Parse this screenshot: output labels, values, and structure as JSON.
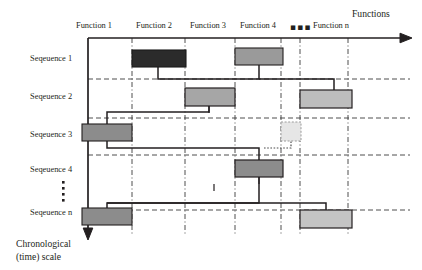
{
  "figure": {
    "type": "sequence-function-gantt-diagram",
    "columns_axis_label": "Functions",
    "rows_axis_label": "Chronological\n(time) scale",
    "horizontal_ellipsis": "▪▪▪",
    "vertical_ellipsis_dots": 5
  },
  "colors": {
    "bar_dark": "#2b2b2b",
    "bar_mid": "#8c8c8c",
    "bar_light": "#b9b9b9",
    "bar_pale": "#c9c9c9",
    "bar_ghost": "#e2e2e2",
    "stroke": "#231f20",
    "grid_dash": "#3a3a3a",
    "text": "#231f20"
  },
  "columns": [
    {
      "label": "Function 1",
      "center_x": 106,
      "divider_x": 132
    },
    {
      "label": "Function 2",
      "center_x": 159,
      "divider_x": 185
    },
    {
      "label": "Function 3",
      "center_x": 210,
      "divider_x": 235
    },
    {
      "label": "Function 4",
      "center_x": 258,
      "divider_x": 281
    },
    {
      "label": "▪▪▪",
      "center_x": 291,
      "divider_x": 300
    },
    {
      "label": "Function n",
      "center_x": 327,
      "divider_x": 348
    }
  ],
  "rows": [
    {
      "label": "Seqeuence 1",
      "label_y": 60,
      "separator_y": 79
    },
    {
      "label": "Seqeuence 2",
      "label_y": 98,
      "separator_y": 118
    },
    {
      "label": "Seqeuence 3",
      "label_y": 136,
      "separator_y": 155
    },
    {
      "label": "Seqeuence 4",
      "label_y": 171,
      "separator_y": 210
    },
    {
      "label": "Seqeuence n",
      "label_y": 214,
      "separator_y": null
    }
  ],
  "bars": [
    {
      "row": "Seqeuence 1",
      "column": "Function 2",
      "x": 132,
      "y": 50,
      "w": 54,
      "h": 17,
      "fill": "#2b2b2b",
      "ghost": false
    },
    {
      "row": "Seqeuence 1",
      "column": "Function 4",
      "x": 235,
      "y": 48,
      "w": 48,
      "h": 17,
      "fill": "#9a9a9a",
      "ghost": false
    },
    {
      "row": "Seqeuence 2",
      "column": "Function 3",
      "x": 185,
      "y": 88,
      "w": 50,
      "h": 18,
      "fill": "#a6a6a6",
      "ghost": false
    },
    {
      "row": "Seqeuence 2",
      "column": "Function n",
      "x": 300,
      "y": 90,
      "w": 52,
      "h": 18,
      "fill": "#bdbdbd",
      "ghost": false
    },
    {
      "row": "Seqeuence 3",
      "column": "Function 1",
      "x": 82,
      "y": 124,
      "w": 50,
      "h": 17,
      "fill": "#8c8c8c",
      "ghost": false
    },
    {
      "row": "Seqeuence 3",
      "column": "Function 4",
      "x": 281,
      "y": 122,
      "w": 20,
      "h": 19,
      "fill": "#e6e6e6",
      "ghost": true
    },
    {
      "row": "Seqeuence 4",
      "column": "Function 4",
      "x": 235,
      "y": 160,
      "w": 48,
      "h": 17,
      "fill": "#8c8c8c",
      "ghost": false
    },
    {
      "row": "Seqeuence n",
      "column": "Function 1",
      "x": 82,
      "y": 208,
      "w": 50,
      "h": 17,
      "fill": "#8c8c8c",
      "ghost": false
    },
    {
      "row": "Seqeuence n",
      "column": "Function n",
      "x": 300,
      "y": 210,
      "w": 52,
      "h": 18,
      "fill": "#c4c4c4",
      "ghost": false
    }
  ],
  "connectors": [
    {
      "from": "Seqeuence 1 / Function 2",
      "to": "Seqeuence 1 / Function 4"
    },
    {
      "from": "Seqeuence 1 / Function 4",
      "to": "Seqeuence 2 / Function n"
    },
    {
      "from": "Seqeuence 2 / Function 3",
      "to": "Seqeuence 3 / Function 1"
    },
    {
      "from": "Seqeuence 3 / Function 1",
      "to": "Seqeuence 4 / Function 4"
    },
    {
      "from": "Seqeuence 4 / Function 4",
      "to": "Seqeuence n / Function 1"
    },
    {
      "from": "Seqeuence n / Function 1",
      "to": "Seqeuence n / Function n"
    }
  ]
}
